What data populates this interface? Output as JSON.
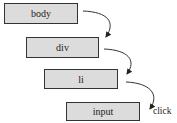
{
  "diagram": {
    "type": "event-propagation",
    "nodes": [
      {
        "id": "body",
        "label": "body"
      },
      {
        "id": "div",
        "label": "div"
      },
      {
        "id": "li",
        "label": "li"
      },
      {
        "id": "input",
        "label": "input"
      }
    ],
    "edges": [
      {
        "from": "body",
        "to": "div"
      },
      {
        "from": "div",
        "to": "li"
      },
      {
        "from": "li",
        "to": "input"
      }
    ],
    "event_label": "click",
    "box_fill": "#dcdcdc",
    "stroke": "#333333"
  }
}
